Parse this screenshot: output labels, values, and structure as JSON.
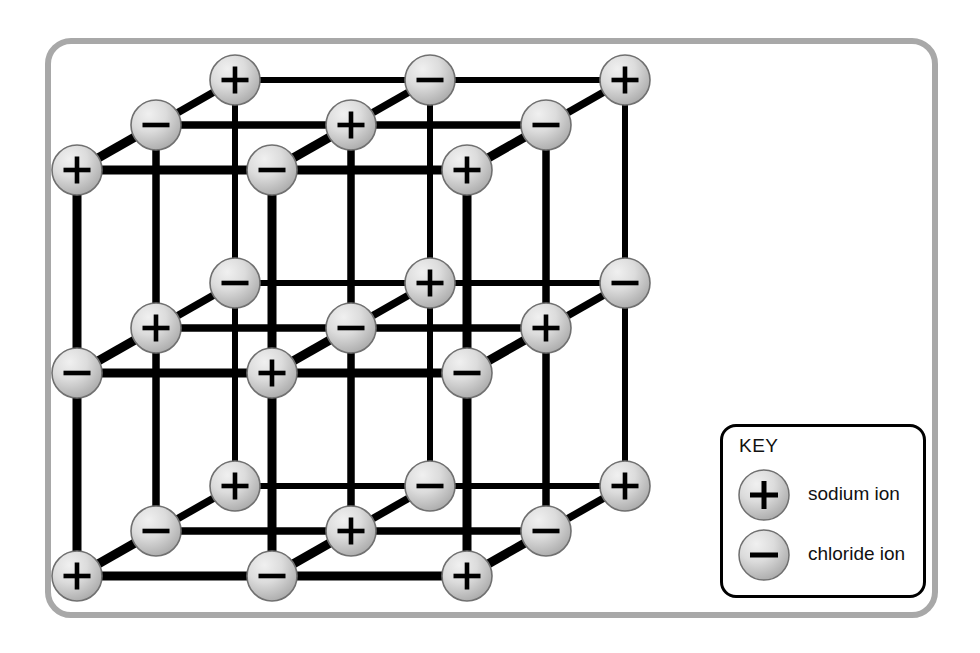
{
  "figure": {
    "type": "diagram",
    "projection": "oblique",
    "grid_dimensions": [
      3,
      3,
      3
    ],
    "colors": {
      "frame": "#a8a8a8",
      "background": "#ffffff",
      "bond": "#000000",
      "ion_fill_light": "#e6e6e6",
      "ion_fill_dark": "#a6a6a6",
      "ion_outline": "#707070",
      "sign": "#000000",
      "key_border": "#000000",
      "text": "#111111"
    },
    "geometry": {
      "origin": [
        235,
        80
      ],
      "step_x": 195,
      "step_y": 203,
      "step_z": [
        -79,
        45
      ],
      "ion_radius": 25,
      "bond_width_front": 9,
      "bond_width_back": 6
    }
  },
  "key": {
    "title": "KEY",
    "items": [
      {
        "sign": "+",
        "label": "sodium ion"
      },
      {
        "sign": "−",
        "label": "chloride ion"
      }
    ]
  },
  "ions": {
    "positive_sign": "+",
    "negative_sign": "−",
    "positive_name": "sodium ion",
    "negative_name": "chloride ion",
    "rule": "charge is positive when (i + j + k) is even",
    "count_total": 27,
    "count_positive": 14,
    "count_negative": 13
  },
  "chart_data": {
    "type": "diagram",
    "legend": [
      "sodium ion",
      "chloride ion"
    ],
    "nodes": [
      {
        "i": 0,
        "j": 0,
        "k": 0,
        "x": 235,
        "y": 80,
        "sign": "+"
      },
      {
        "i": 1,
        "j": 0,
        "k": 0,
        "x": 430,
        "y": 80,
        "sign": "−"
      },
      {
        "i": 2,
        "j": 0,
        "k": 0,
        "x": 625,
        "y": 80,
        "sign": "+"
      },
      {
        "i": 0,
        "j": 0,
        "k": 1,
        "x": 156,
        "y": 125,
        "sign": "−"
      },
      {
        "i": 1,
        "j": 0,
        "k": 1,
        "x": 351,
        "y": 125,
        "sign": "+"
      },
      {
        "i": 2,
        "j": 0,
        "k": 1,
        "x": 546,
        "y": 125,
        "sign": "−"
      },
      {
        "i": 0,
        "j": 0,
        "k": 2,
        "x": 77,
        "y": 170,
        "sign": "+"
      },
      {
        "i": 1,
        "j": 0,
        "k": 2,
        "x": 272,
        "y": 170,
        "sign": "−"
      },
      {
        "i": 2,
        "j": 0,
        "k": 2,
        "x": 467,
        "y": 170,
        "sign": "+"
      },
      {
        "i": 0,
        "j": 1,
        "k": 0,
        "x": 235,
        "y": 283,
        "sign": "−"
      },
      {
        "i": 1,
        "j": 1,
        "k": 0,
        "x": 430,
        "y": 283,
        "sign": "+"
      },
      {
        "i": 2,
        "j": 1,
        "k": 0,
        "x": 625,
        "y": 283,
        "sign": "−"
      },
      {
        "i": 0,
        "j": 1,
        "k": 1,
        "x": 156,
        "y": 328,
        "sign": "+"
      },
      {
        "i": 1,
        "j": 1,
        "k": 1,
        "x": 351,
        "y": 328,
        "sign": "−"
      },
      {
        "i": 2,
        "j": 1,
        "k": 1,
        "x": 546,
        "y": 328,
        "sign": "+"
      },
      {
        "i": 0,
        "j": 1,
        "k": 2,
        "x": 77,
        "y": 373,
        "sign": "−"
      },
      {
        "i": 1,
        "j": 1,
        "k": 2,
        "x": 272,
        "y": 373,
        "sign": "+"
      },
      {
        "i": 2,
        "j": 1,
        "k": 2,
        "x": 467,
        "y": 373,
        "sign": "−"
      },
      {
        "i": 0,
        "j": 2,
        "k": 0,
        "x": 235,
        "y": 486,
        "sign": "+"
      },
      {
        "i": 1,
        "j": 2,
        "k": 0,
        "x": 430,
        "y": 486,
        "sign": "−"
      },
      {
        "i": 2,
        "j": 2,
        "k": 0,
        "x": 625,
        "y": 486,
        "sign": "+"
      },
      {
        "i": 0,
        "j": 2,
        "k": 1,
        "x": 156,
        "y": 531,
        "sign": "−"
      },
      {
        "i": 1,
        "j": 2,
        "k": 1,
        "x": 351,
        "y": 531,
        "sign": "+"
      },
      {
        "i": 2,
        "j": 2,
        "k": 1,
        "x": 546,
        "y": 531,
        "sign": "−"
      },
      {
        "i": 0,
        "j": 2,
        "k": 2,
        "x": 77,
        "y": 576,
        "sign": "+"
      },
      {
        "i": 1,
        "j": 2,
        "k": 2,
        "x": 272,
        "y": 576,
        "sign": "−"
      },
      {
        "i": 2,
        "j": 2,
        "k": 2,
        "x": 467,
        "y": 576,
        "sign": "+"
      }
    ]
  }
}
